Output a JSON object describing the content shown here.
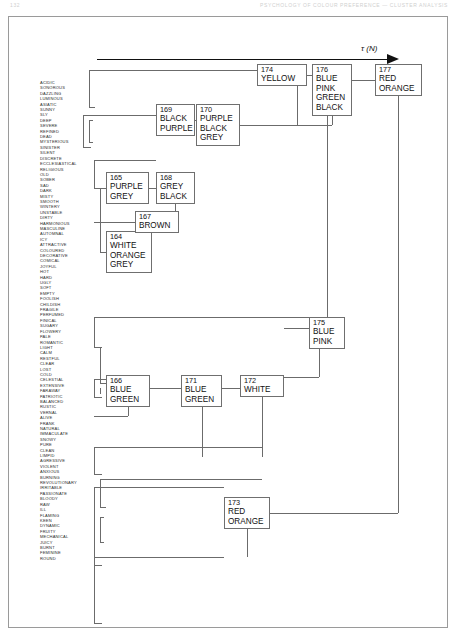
{
  "page": {
    "folio": "132",
    "running_head": "PSYCHOLOGY OF COLOUR PREFERENCE  —  CLUSTER ANALYSIS"
  },
  "axis": {
    "label": "τ (N)",
    "arrow": "right-arrow"
  },
  "labels": [
    "ACIDIC",
    "SONOROUS",
    "DAZZLING",
    "LUMINOUS",
    "ASIATIC",
    "SUNNY",
    "SLY",
    "DEEP",
    "SEVERE",
    "REFINED",
    "DEAD",
    "MYSTERIOUS",
    "SINISTER",
    "SILENT",
    "DISCRETE",
    "ECCLESIASTICAL",
    "RELIGIOUS",
    "OLD",
    "SOBER",
    "SAD",
    "DARK",
    "MISTY",
    "SMOOTH",
    "WINTERY",
    "UNSTABLE",
    "DIRTY",
    "HARMONIOUS",
    "MASCULINE",
    "AUTOMNAL",
    "ICY",
    "ATTRACTIVE",
    "COLOURED",
    "DECORATIVE",
    "COMICAL",
    "JOYFUL",
    "HOT",
    "HARD",
    "UGLY",
    "SOFT",
    "EMPTY",
    "FOOLISH",
    "CHILDISH",
    "FRAGILE",
    "PERFUMED",
    "FINICAL",
    "SUGARY",
    "FLOWERY",
    "PALE",
    "ROMANTIC",
    "LIGHT",
    "CALM",
    "RESTFUL",
    "CLEAR",
    "LOST",
    "COLD",
    "CELESTIAL",
    "EXTENSIVE",
    "FARAWAY",
    "PATRIOTIC",
    "BALANCED",
    "RUSTIC",
    "VERNAL",
    "ALIVE",
    "FRANK",
    "NATURAL",
    "IMMACULATE",
    "SNOWY",
    "PURE",
    "CLEAN",
    "LIMPID",
    "AGRESSIVE",
    "VIOLENT",
    "ANXIOUS",
    "BURNING",
    "REVOLUTIONARY",
    "IRRITABLE",
    "PASSIONATE",
    "BLOODY",
    "RAW",
    "ILL",
    "FLAMING",
    "KEEN",
    "DYNAMIC",
    "FRUITY",
    "MECHANICAL",
    "JUICY",
    "BURNT",
    "FEMININE",
    "ROUND"
  ],
  "nodes": [
    {
      "id": "164",
      "members": [
        "WHITE",
        "ORANGE",
        "GREY"
      ]
    },
    {
      "id": "165",
      "members": [
        "PURPLE",
        "GREY"
      ]
    },
    {
      "id": "166",
      "members": [
        "BLUE",
        "GREEN"
      ]
    },
    {
      "id": "167",
      "members": [
        "BROWN"
      ]
    },
    {
      "id": "168",
      "members": [
        "GREY",
        "BLACK"
      ]
    },
    {
      "id": "169",
      "members": [
        "BLACK",
        "PURPLE"
      ]
    },
    {
      "id": "170",
      "members": [
        "PURPLE",
        "BLACK",
        "GREY"
      ]
    },
    {
      "id": "171",
      "members": [
        "BLUE",
        "GREEN"
      ]
    },
    {
      "id": "172",
      "members": [
        "WHITE"
      ]
    },
    {
      "id": "173",
      "members": [
        "RED",
        "ORANGE"
      ]
    },
    {
      "id": "174",
      "members": [
        "YELLOW"
      ]
    },
    {
      "id": "175",
      "members": [
        "BLUE",
        "PINK"
      ]
    },
    {
      "id": "176",
      "members": [
        "BLUE",
        "PINK",
        "GREEN",
        "BLACK"
      ]
    },
    {
      "id": "177",
      "members": [
        "RED",
        "ORANGE"
      ]
    }
  ],
  "chart_data": {
    "type": "diagram",
    "subtype": "dendrogram",
    "title": "",
    "xlabel": "τ (N)",
    "ylabel": "",
    "direction": "left-to-right",
    "leaf_count": 89,
    "cluster_count": 14,
    "merges": [
      {
        "id": "164",
        "label": "WHITE ORANGE GREY"
      },
      {
        "id": "165",
        "label": "PURPLE GREY"
      },
      {
        "id": "166",
        "label": "BLUE GREEN"
      },
      {
        "id": "167",
        "label": "BROWN"
      },
      {
        "id": "168",
        "label": "GREY BLACK",
        "children": [
          "165",
          "164"
        ]
      },
      {
        "id": "169",
        "label": "BLACK PURPLE"
      },
      {
        "id": "170",
        "label": "PURPLE BLACK GREY",
        "children": [
          "169",
          "168"
        ]
      },
      {
        "id": "171",
        "label": "BLUE GREEN",
        "children": [
          "166"
        ]
      },
      {
        "id": "172",
        "label": "WHITE",
        "children": [
          "171"
        ]
      },
      {
        "id": "173",
        "label": "RED ORANGE"
      },
      {
        "id": "174",
        "label": "YELLOW"
      },
      {
        "id": "175",
        "label": "BLUE PINK",
        "children": [
          "172"
        ]
      },
      {
        "id": "176",
        "label": "BLUE PINK GREEN BLACK",
        "children": [
          "174",
          "170",
          "175"
        ]
      },
      {
        "id": "177",
        "label": "RED ORANGE",
        "children": [
          "176",
          "173"
        ]
      }
    ]
  }
}
